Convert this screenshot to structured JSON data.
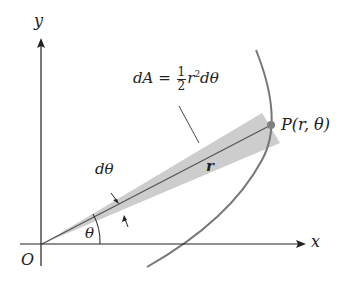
{
  "diagram": {
    "axes": {
      "x_label": "x",
      "y_label": "y",
      "origin_label": "O"
    },
    "annotations": {
      "area_formula": {
        "lhs": "dA =",
        "frac_num": "1",
        "frac_den": "2",
        "r": "r",
        "exp": "2",
        "tail": "dθ"
      },
      "point_label": "P(r, θ)",
      "radius_label": "r",
      "angle_label": "θ",
      "dtheta_label": "dθ"
    },
    "colors": {
      "axis": "#222222",
      "curve": "#777777",
      "wedge_fill": "#c8c8c8",
      "point": "#808080",
      "text": "#222222"
    },
    "geometry": {
      "origin": [
        42,
        244
      ],
      "point_P": [
        271,
        125
      ],
      "x_axis_end": [
        303,
        244
      ],
      "y_axis_top": [
        41,
        40
      ]
    }
  }
}
